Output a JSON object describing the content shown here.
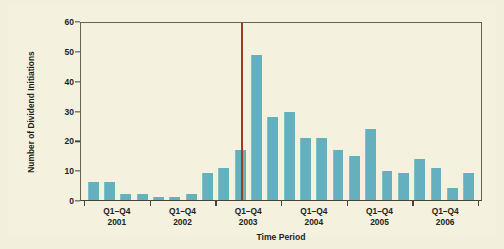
{
  "chart_data": {
    "type": "bar",
    "title": "",
    "xlabel": "Time Period",
    "ylabel": "Number of Dividend Initiations",
    "ylim": [
      0,
      60
    ],
    "yticks": [
      0,
      10,
      20,
      30,
      40,
      50,
      60
    ],
    "grid": false,
    "legend": "none",
    "categories": [
      "2001 Q1",
      "2001 Q2",
      "2001 Q3",
      "2001 Q4",
      "2002 Q1",
      "2002 Q2",
      "2002 Q3",
      "2002 Q4",
      "2003 Q1",
      "2003 Q2",
      "2003 Q3",
      "2003 Q4",
      "2004 Q1",
      "2004 Q2",
      "2004 Q3",
      "2004 Q4",
      "2005 Q1",
      "2005 Q2",
      "2005 Q3",
      "2005 Q4",
      "2006 Q1",
      "2006 Q2",
      "2006 Q3",
      "2006 Q4"
    ],
    "values": [
      6,
      6,
      2,
      2,
      1,
      1,
      2,
      9,
      11,
      17,
      49,
      28,
      30,
      21,
      21,
      17,
      15,
      24,
      10,
      9,
      14,
      11,
      4,
      9
    ],
    "xtick_group_labels": [
      {
        "quarters": "Q1–Q4",
        "year": "2001"
      },
      {
        "quarters": "Q1–Q4",
        "year": "2002"
      },
      {
        "quarters": "Q1–Q4",
        "year": "2003"
      },
      {
        "quarters": "Q1–Q4",
        "year": "2004"
      },
      {
        "quarters": "Q1–Q4",
        "year": "2005"
      },
      {
        "quarters": "Q1–Q4",
        "year": "2006"
      }
    ],
    "annotations": [
      {
        "name": "event-line",
        "type": "vertical-line",
        "at_index": 9.5,
        "color": "#a03a20"
      }
    ],
    "colors": {
      "bar": "#64b0bf",
      "event_line": "#a03a20",
      "background": "#f4f2de",
      "axis": "#4a4438",
      "text": "#231f20"
    }
  }
}
